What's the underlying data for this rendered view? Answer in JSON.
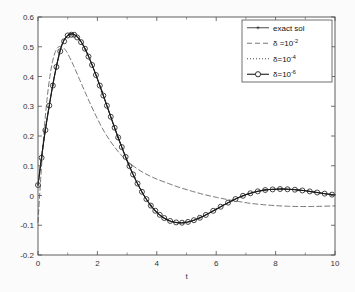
{
  "figure": {
    "background_color": "#fbfbfb",
    "plot_area_color": "#ffffff",
    "axis_color": "#4d4d4d",
    "curve_color": "#1a1a1a"
  },
  "chart_data": {
    "type": "line",
    "title": "",
    "xlabel": "t",
    "ylabel": "",
    "xlim": [
      0,
      10
    ],
    "ylim": [
      -0.2,
      0.6
    ],
    "xticks": [
      0,
      2,
      4,
      6,
      8,
      10
    ],
    "xtick_labels": [
      "0",
      "2",
      "4",
      "6",
      "8",
      "10"
    ],
    "yticks": [
      -0.2,
      -0.1,
      0,
      0.1,
      0.2,
      0.3,
      0.4,
      0.5,
      0.6
    ],
    "ytick_labels": [
      "-0.2",
      "-0.1",
      "0",
      "0.1",
      "0.2",
      "0.3",
      "0.4",
      "0.5",
      "0.6"
    ],
    "xminor_ticks": [
      1,
      3,
      5,
      7,
      9
    ],
    "grid": false,
    "legend_position": "upper right",
    "series": [
      {
        "name": "exact sol",
        "label_main": "exact sol",
        "label_sup": "",
        "style": "solid",
        "marker": "star",
        "color": "#1a1a1a",
        "x": [
          0,
          0.2,
          0.4,
          0.6,
          0.8,
          1.0,
          1.2,
          1.4,
          1.6,
          1.8,
          2.0,
          2.2,
          2.4,
          2.6,
          2.8,
          3.0,
          3.2,
          3.4,
          3.6,
          3.8,
          4.0,
          4.2,
          4.4,
          4.6,
          4.8,
          5.0,
          5.2,
          5.4,
          5.6,
          5.8,
          6.0,
          6.2,
          6.4,
          6.6,
          6.8,
          7.0,
          7.2,
          7.4,
          7.6,
          7.8,
          8.0,
          8.2,
          8.4,
          8.6,
          8.8,
          9.0,
          9.2,
          9.4,
          9.6,
          9.8,
          10.0
        ],
        "y": [
          0.035,
          0.188,
          0.315,
          0.424,
          0.505,
          0.538,
          0.542,
          0.524,
          0.49,
          0.444,
          0.392,
          0.336,
          0.279,
          0.222,
          0.168,
          0.117,
          0.071,
          0.03,
          -0.005,
          -0.034,
          -0.057,
          -0.073,
          -0.084,
          -0.09,
          -0.092,
          -0.09,
          -0.085,
          -0.077,
          -0.068,
          -0.057,
          -0.046,
          -0.035,
          -0.024,
          -0.014,
          -0.005,
          0.003,
          0.009,
          0.014,
          0.018,
          0.02,
          0.021,
          0.022,
          0.021,
          0.02,
          0.018,
          0.016,
          0.013,
          0.01,
          0.007,
          0.004,
          0.002
        ]
      },
      {
        "name": "delta 1e-2",
        "label_main": "δ =10",
        "label_sup": "-2",
        "style": "dashed",
        "marker": "none",
        "color": "#555555",
        "x": [
          0,
          0.1,
          0.2,
          0.3,
          0.4,
          0.5,
          0.6,
          0.7,
          0.8,
          0.9,
          1.0,
          1.2,
          1.4,
          1.6,
          1.8,
          2.0,
          2.2,
          2.4,
          2.6,
          2.8,
          3.0,
          3.2,
          3.4,
          3.6,
          3.8,
          4.0,
          4.4,
          4.8,
          5.2,
          5.6,
          6.0,
          6.4,
          6.8,
          7.2,
          7.6,
          8.0,
          8.4,
          8.8,
          9.2,
          9.6,
          10.0
        ],
        "y": [
          -0.09,
          0.07,
          0.21,
          0.32,
          0.4,
          0.455,
          0.487,
          0.5,
          0.5,
          0.492,
          0.477,
          0.436,
          0.39,
          0.344,
          0.3,
          0.258,
          0.22,
          0.188,
          0.16,
          0.136,
          0.116,
          0.1,
          0.086,
          0.074,
          0.064,
          0.055,
          0.04,
          0.026,
          0.014,
          0.003,
          -0.006,
          -0.014,
          -0.021,
          -0.027,
          -0.031,
          -0.034,
          -0.036,
          -0.037,
          -0.037,
          -0.036,
          -0.035
        ]
      },
      {
        "name": "delta 1e-4",
        "label_main": "δ=10",
        "label_sup": "-4",
        "style": "dotted",
        "marker": "none",
        "color": "#1a1a1a",
        "x": [
          0,
          0.2,
          0.4,
          0.6,
          0.8,
          1.0,
          1.2,
          1.4,
          1.6,
          1.8,
          2.0,
          2.2,
          2.4,
          2.6,
          2.8,
          3.0,
          3.2,
          3.4,
          3.6,
          3.8,
          4.0,
          4.2,
          4.4,
          4.6,
          4.8,
          5.0,
          5.2,
          5.4,
          5.6,
          5.8,
          6.0,
          6.2,
          6.4,
          6.6,
          6.8,
          7.0,
          7.2,
          7.4,
          7.6,
          7.8,
          8.0,
          8.2,
          8.4,
          8.6,
          8.8,
          9.0,
          9.2,
          9.4,
          9.6,
          9.8,
          10.0
        ],
        "y": [
          0.035,
          0.188,
          0.315,
          0.424,
          0.505,
          0.538,
          0.542,
          0.524,
          0.49,
          0.444,
          0.392,
          0.336,
          0.279,
          0.222,
          0.168,
          0.117,
          0.071,
          0.03,
          -0.005,
          -0.034,
          -0.057,
          -0.073,
          -0.084,
          -0.09,
          -0.092,
          -0.09,
          -0.085,
          -0.077,
          -0.068,
          -0.057,
          -0.046,
          -0.035,
          -0.024,
          -0.014,
          -0.005,
          0.003,
          0.009,
          0.014,
          0.018,
          0.02,
          0.021,
          0.022,
          0.021,
          0.02,
          0.018,
          0.016,
          0.013,
          0.01,
          0.007,
          0.004,
          0.002
        ]
      },
      {
        "name": "delta 1e-6",
        "label_main": "δ=10",
        "label_sup": "-6",
        "style": "solid",
        "marker": "circle",
        "color": "#1a1a1a",
        "x": [
          0,
          0.2,
          0.4,
          0.6,
          0.8,
          1.0,
          1.2,
          1.4,
          1.6,
          1.8,
          2.0,
          2.2,
          2.4,
          2.6,
          2.8,
          3.0,
          3.2,
          3.4,
          3.6,
          3.8,
          4.0,
          4.2,
          4.4,
          4.6,
          4.8,
          5.0,
          5.2,
          5.4,
          5.6,
          5.8,
          6.0,
          6.2,
          6.4,
          6.6,
          6.8,
          7.0,
          7.2,
          7.4,
          7.6,
          7.8,
          8.0,
          8.2,
          8.4,
          8.6,
          8.8,
          9.0,
          9.2,
          9.4,
          9.6,
          9.8,
          10.0
        ],
        "y": [
          0.035,
          0.188,
          0.315,
          0.424,
          0.505,
          0.538,
          0.542,
          0.524,
          0.49,
          0.444,
          0.392,
          0.336,
          0.279,
          0.222,
          0.168,
          0.117,
          0.071,
          0.03,
          -0.005,
          -0.034,
          -0.057,
          -0.073,
          -0.084,
          -0.09,
          -0.092,
          -0.09,
          -0.085,
          -0.077,
          -0.068,
          -0.057,
          -0.046,
          -0.035,
          -0.024,
          -0.014,
          -0.005,
          0.003,
          0.009,
          0.014,
          0.018,
          0.02,
          0.021,
          0.022,
          0.021,
          0.02,
          0.018,
          0.016,
          0.013,
          0.01,
          0.007,
          0.004,
          0.002
        ],
        "marker_x": [
          0,
          0.12,
          0.25,
          0.38,
          0.5,
          0.62,
          0.75,
          0.88,
          1.0,
          1.12,
          1.22,
          1.32,
          1.45,
          1.58,
          1.7,
          1.82,
          1.95,
          2.08,
          2.2,
          2.32,
          2.45,
          2.58,
          2.7,
          2.82,
          2.95,
          3.08,
          3.2,
          3.35,
          3.5,
          3.65,
          3.8,
          3.95,
          4.1,
          4.25,
          4.45,
          4.65,
          4.85,
          5.05,
          5.25,
          5.45,
          5.65,
          5.9,
          6.15,
          6.4,
          6.65,
          6.9,
          7.15,
          7.4,
          7.65,
          7.9,
          8.15,
          8.4,
          8.65,
          8.9,
          9.15,
          9.4,
          9.65,
          9.9
        ]
      }
    ]
  }
}
